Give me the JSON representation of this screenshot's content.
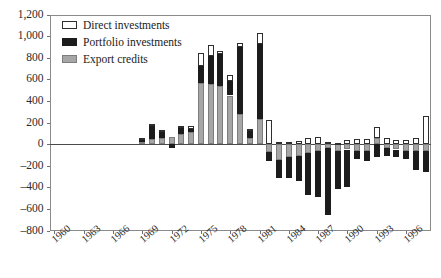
{
  "chart_data": {
    "type": "bar",
    "subtype": "stacked-bar",
    "title": "",
    "xlabel": "",
    "ylabel": "",
    "ylim": [
      -800,
      1200
    ],
    "ytick_step": 200,
    "yticks": [
      "1,200",
      "1,000",
      "800",
      "600",
      "400",
      "200",
      "0",
      "-200",
      "-400",
      "-600",
      "-800"
    ],
    "ytick_values": [
      1200,
      1000,
      800,
      600,
      400,
      200,
      0,
      -200,
      -400,
      -600,
      -800
    ],
    "grid": false,
    "legend_position": "top-left",
    "xtick_labels": [
      "1960",
      "1963",
      "1966",
      "1969",
      "1972",
      "1975",
      "1978",
      "1981",
      "1984",
      "1987",
      "1990",
      "1993",
      "1996"
    ],
    "xtick_step": 3,
    "x_start": 1960,
    "x_end": 1998,
    "categories": [
      "1960",
      "1961",
      "1962",
      "1963",
      "1964",
      "1965",
      "1966",
      "1967",
      "1968",
      "1969",
      "1970",
      "1971",
      "1972",
      "1973",
      "1974",
      "1975",
      "1976",
      "1977",
      "1978",
      "1979",
      "1980",
      "1981",
      "1982",
      "1983",
      "1984",
      "1985",
      "1986",
      "1987",
      "1988",
      "1989",
      "1990",
      "1991",
      "1992",
      "1993",
      "1994",
      "1995",
      "1996",
      "1997",
      "1998"
    ],
    "series": [
      {
        "name": "Direct investments",
        "color": "#ffffff",
        "edge_color": "#2e2e2e",
        "values": [
          0,
          0,
          0,
          0,
          0,
          0,
          0,
          0,
          0,
          10,
          10,
          10,
          0,
          10,
          30,
          120,
          100,
          30,
          60,
          40,
          20,
          100,
          220,
          20,
          20,
          30,
          60,
          70,
          20,
          10,
          40,
          50,
          50,
          100,
          60,
          40,
          40,
          60,
          260
        ]
      },
      {
        "name": "Portfolio investments",
        "color": "#1c1c1c",
        "edge_color": "#1c1c1c",
        "values": [
          0,
          0,
          0,
          0,
          0,
          0,
          0,
          0,
          0,
          30,
          130,
          60,
          -40,
          70,
          30,
          150,
          260,
          290,
          130,
          620,
          60,
          700,
          -90,
          -160,
          -190,
          -230,
          -390,
          -430,
          -620,
          -360,
          -350,
          -80,
          -100,
          -120,
          -70,
          -70,
          -80,
          -180,
          -200
        ]
      },
      {
        "name": "Export credits",
        "color": "#a6a6a6",
        "edge_color": "#7d7d7d",
        "values": [
          0,
          0,
          0,
          0,
          0,
          0,
          0,
          0,
          0,
          20,
          50,
          60,
          70,
          90,
          110,
          570,
          560,
          540,
          450,
          280,
          60,
          230,
          -70,
          -150,
          -120,
          -110,
          -80,
          -60,
          -40,
          -60,
          -50,
          -60,
          -60,
          60,
          -40,
          -50,
          -60,
          -60,
          -60
        ]
      }
    ]
  },
  "legend": {
    "items": [
      {
        "label": "Direct investments",
        "style": "direct"
      },
      {
        "label": "Portfolio investments",
        "style": "portfolio"
      },
      {
        "label": "Export credits",
        "style": "export"
      }
    ]
  },
  "colors": {
    "direct": "#ffffff",
    "direct_edge": "#2e2e2e",
    "portfolio": "#1c1c1c",
    "export": "#a6a6a6",
    "export_edge": "#7d7d7d",
    "axis": "#8a8a8a",
    "zero_line": "#4a4a4a"
  }
}
